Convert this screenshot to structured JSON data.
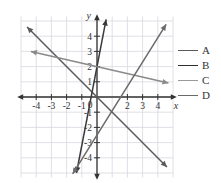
{
  "chart_data": {
    "type": "line",
    "title": "",
    "xlabel": "x",
    "ylabel": "y",
    "xlim": [
      -5,
      5
    ],
    "ylim": [
      -5,
      5
    ],
    "grid": true,
    "grid_step": 1,
    "xticks": [
      -4,
      -3,
      -2,
      -1,
      2,
      3,
      4
    ],
    "yticks": [
      4,
      3,
      2,
      1,
      -1,
      -2,
      -3,
      -4
    ],
    "xtick_labels": [
      "-4",
      "-3",
      "-2",
      "-1",
      "2",
      "3",
      "4"
    ],
    "ytick_labels": [
      "4",
      "3",
      "2",
      "1",
      "-1",
      "-2",
      "-3",
      "-4"
    ],
    "origin_label": "0",
    "legend_position": "right",
    "series": [
      {
        "name": "A",
        "color": "#5a5a5a",
        "slope": -1.0,
        "intercept": 0.0,
        "x": [
          -4.6,
          4.6
        ],
        "y": [
          4.6,
          -4.6
        ],
        "arrows": "both"
      },
      {
        "name": "B",
        "color": "#3a3a3a",
        "slope": 5.2,
        "intercept": 2.0,
        "x": [
          -1.35,
          0.6
        ],
        "y": [
          -5.0,
          5.1
        ],
        "arrows": "both"
      },
      {
        "name": "C",
        "color": "#8a8a8a",
        "slope": -0.23,
        "intercept": 2.0,
        "x": [
          -4.35,
          4.7
        ],
        "y": [
          3.0,
          0.92
        ],
        "arrows": "both"
      },
      {
        "name": "D",
        "color": "#6a6a6a",
        "slope": 1.6,
        "intercept": -2.5,
        "x": [
          -1.6,
          4.55
        ],
        "y": [
          -5.06,
          4.78
        ],
        "arrows": "both"
      }
    ]
  },
  "legend": {
    "items": [
      {
        "label": "A",
        "color": "#5a5a5a"
      },
      {
        "label": "B",
        "color": "#2e2e2e"
      },
      {
        "label": "C",
        "color": "#9a9a9a"
      },
      {
        "label": "D",
        "color": "#6a6a6a"
      }
    ]
  },
  "axes": {
    "x_axis_label": "x",
    "y_axis_label": "y"
  },
  "colors": {
    "grid": "#d8d8e0",
    "axis": "#333333",
    "text": "#333333",
    "background": "#ffffff"
  }
}
